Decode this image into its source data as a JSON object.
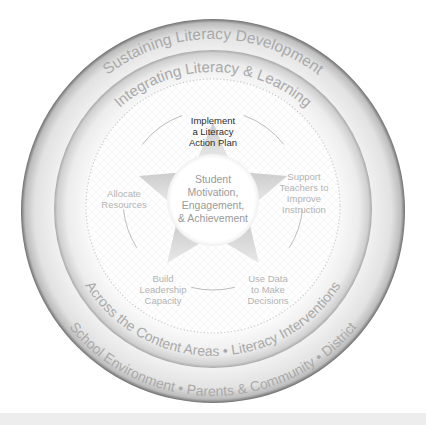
{
  "diagram": {
    "outer_ring": {
      "top_text": "Sustaining Literacy Development",
      "bottom_text": "School Environment • Parents & Community • District"
    },
    "middle_ring": {
      "top_text": "Integrating Literacy & Learning",
      "bottom_text": "Across the Content Areas • Literacy Interventions"
    },
    "center": {
      "lines": [
        "Student",
        "Motivation,",
        "Engagement,",
        "& Achievement"
      ]
    },
    "star_labels": [
      {
        "id": "implement",
        "lines": [
          "Implement",
          "a Literacy",
          "Action Plan"
        ],
        "emphasized": true
      },
      {
        "id": "support",
        "lines": [
          "Support",
          "Teachers to",
          "Improve",
          "Instruction"
        ],
        "emphasized": false
      },
      {
        "id": "use-data",
        "lines": [
          "Use Data",
          "to Make",
          "Decisions"
        ],
        "emphasized": false
      },
      {
        "id": "build",
        "lines": [
          "Build",
          "Leadership",
          "Capacity"
        ],
        "emphasized": false
      },
      {
        "id": "allocate",
        "lines": [
          "Allocate",
          "Resources"
        ],
        "emphasized": false
      }
    ],
    "colors": {
      "ring_text": "#a9a9a9",
      "label_text": "#b3b3b3",
      "emphasized_label_text": "#2e2e2e",
      "center_text": "#9a9a9a",
      "star_point": "#cfcfcf",
      "arc": "#bdbdbd"
    }
  }
}
